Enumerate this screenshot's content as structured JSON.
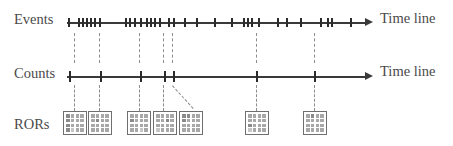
{
  "figure": {
    "type": "diagram",
    "title": "",
    "background": "#ffffff",
    "axis_color": "#3a3a3a",
    "tick_color": "#2b2b2b",
    "dash_color": "#8d8d8d",
    "grid_fill": "#a8a8a8",
    "grid_line": "#ffffff",
    "label_color": "#4a4a4a",
    "width": 453,
    "height": 146
  },
  "rows": [
    {
      "id": "events",
      "label": "Events",
      "axis_label": "Time line",
      "label_x": 14,
      "label_y": 12,
      "axis_label_x": 380,
      "axis_label_y": 11,
      "axis_x": 67,
      "axis_y": 22,
      "axis_len": 306,
      "tick_class": "ev",
      "ticks": [
        68,
        78,
        82,
        86,
        90,
        94,
        99,
        125,
        129,
        134,
        140,
        146,
        150,
        154,
        159,
        168,
        173,
        184,
        196,
        214,
        231,
        243,
        247,
        251,
        258,
        277,
        286,
        300,
        320,
        327,
        331,
        350
      ]
    },
    {
      "id": "counts",
      "label": "Counts",
      "axis_label": "Time line",
      "label_x": 14,
      "label_y": 66,
      "axis_label_x": 380,
      "axis_label_y": 64,
      "axis_x": 67,
      "axis_y": 76,
      "axis_len": 306,
      "tick_class": "ct",
      "ticks": [
        69,
        100,
        140,
        164,
        173,
        256,
        314
      ]
    },
    {
      "id": "rors",
      "label": "RORs",
      "label_x": 14,
      "label_y": 117
    }
  ],
  "vertical_dashes": [
    {
      "x": 74,
      "y": 33,
      "height": 30
    },
    {
      "x": 99,
      "y": 33,
      "height": 30
    },
    {
      "x": 139,
      "y": 33,
      "height": 30
    },
    {
      "x": 163,
      "y": 33,
      "height": 30
    },
    {
      "x": 172,
      "y": 33,
      "height": 30
    },
    {
      "x": 256,
      "y": 33,
      "height": 30
    },
    {
      "x": 314,
      "y": 33,
      "height": 30
    },
    {
      "x": 74,
      "y": 85,
      "height": 26
    },
    {
      "x": 99,
      "y": 85,
      "height": 26
    },
    {
      "x": 139,
      "y": 85,
      "height": 26
    },
    {
      "x": 163,
      "y": 85,
      "height": 26
    },
    {
      "x": 256,
      "y": 85,
      "height": 26
    },
    {
      "x": 314,
      "y": 85,
      "height": 26
    }
  ],
  "diagonal_dash": {
    "x1": 172,
    "y1": 86,
    "x2": 193,
    "y2": 109
  },
  "ror_grids": [
    {
      "x": 64,
      "y": 112,
      "size": 22,
      "n": 4,
      "cells": [
        "dark",
        "",
        "",
        "",
        "dark",
        "",
        "",
        "",
        "dark",
        "",
        "",
        "",
        "dark",
        "light",
        "",
        ""
      ]
    },
    {
      "x": 89,
      "y": 112,
      "size": 22,
      "n": 4,
      "cells": [
        "",
        "",
        "",
        "",
        "",
        "dark",
        "",
        "",
        "",
        "",
        "",
        "",
        "",
        "",
        "",
        ""
      ]
    },
    {
      "x": 128,
      "y": 112,
      "size": 22,
      "n": 4,
      "cells": [
        "",
        "",
        "",
        "",
        "dark",
        "",
        "",
        "",
        "",
        "",
        "",
        "",
        "",
        "",
        "light",
        ""
      ]
    },
    {
      "x": 154,
      "y": 112,
      "size": 22,
      "n": 4,
      "cells": [
        "",
        "",
        "",
        "",
        "",
        "",
        "dark",
        "",
        "",
        "",
        "",
        "",
        "light",
        "",
        "",
        ""
      ]
    },
    {
      "x": 180,
      "y": 112,
      "size": 22,
      "n": 4,
      "cells": [
        "dark",
        "dark",
        "",
        "",
        "dark",
        "",
        "",
        "",
        "",
        "",
        "",
        "",
        "",
        "",
        "",
        ""
      ]
    },
    {
      "x": 246,
      "y": 112,
      "size": 22,
      "n": 4,
      "cells": [
        "",
        "",
        "",
        "",
        "",
        "",
        "",
        "",
        "dark",
        "",
        "",
        "",
        "light",
        "",
        "",
        ""
      ]
    },
    {
      "x": 304,
      "y": 112,
      "size": 22,
      "n": 4,
      "cells": [
        "",
        "dark",
        "",
        "",
        "",
        "",
        "",
        "",
        "",
        "",
        "",
        "",
        "",
        "",
        "",
        ""
      ]
    }
  ]
}
